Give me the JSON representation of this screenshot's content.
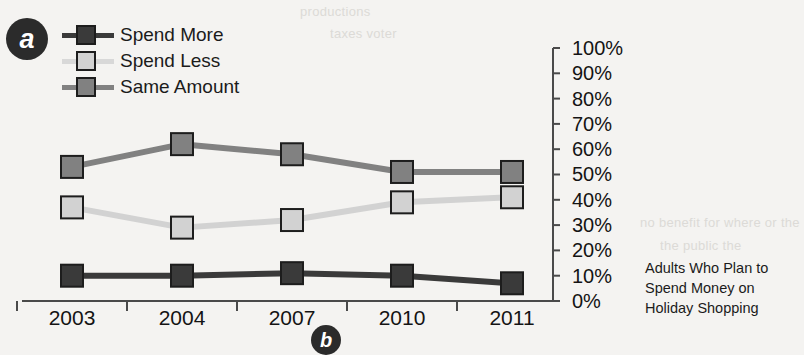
{
  "badges": {
    "panel_a": "a",
    "panel_b": "b"
  },
  "legend": {
    "position": "top-left",
    "items": [
      {
        "label": "Spend More",
        "color": "#3a3a3a"
      },
      {
        "label": "Spend Less",
        "color": "#d2d2d2"
      },
      {
        "label": "Same Amount",
        "color": "#818181"
      }
    ]
  },
  "caption": {
    "line1": "Adults Who Plan to",
    "line2": "Spend Money on",
    "line3": "Holiday Shopping"
  },
  "background_text": {
    "t1": "productions",
    "t2": "taxes voter",
    "t3": "no benefit for where or the",
    "t4": "the public the"
  },
  "chart_data": {
    "type": "line",
    "title": "Adults Who Plan to Spend Money on Holiday Shopping",
    "xlabel": "",
    "ylabel": "",
    "categories": [
      "2003",
      "2004",
      "2007",
      "2010",
      "2011"
    ],
    "series": [
      {
        "name": "Spend More",
        "color": "#3a3a3a",
        "values": [
          10,
          10,
          11,
          10,
          7
        ]
      },
      {
        "name": "Spend Less",
        "color": "#d2d2d2",
        "values": [
          37,
          29,
          32,
          39,
          41
        ]
      },
      {
        "name": "Same Amount",
        "color": "#818181",
        "values": [
          53,
          62,
          58,
          51,
          51
        ]
      }
    ],
    "ylim": [
      0,
      100
    ],
    "ytick_labels": [
      "100%",
      "90%",
      "80%",
      "70%",
      "60%",
      "50%",
      "40%",
      "30%",
      "20%",
      "10%",
      "0%"
    ],
    "ytick_values": [
      100,
      90,
      80,
      70,
      60,
      50,
      40,
      30,
      20,
      10,
      0
    ],
    "yaxis_position": "right",
    "grid": false,
    "legend_position": "top-left",
    "marker": "square"
  }
}
